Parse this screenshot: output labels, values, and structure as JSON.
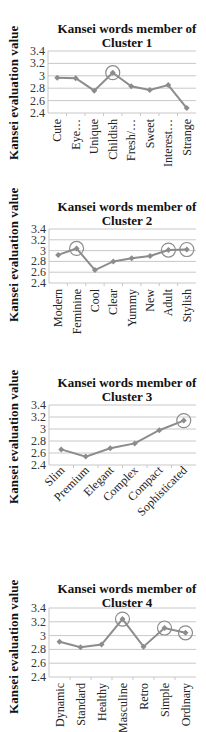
{
  "y_axis_label": "Kansei evaluation value",
  "y_ticks": [
    "3.4",
    "3.2",
    "3",
    "2.8",
    "2.6",
    "2.4"
  ],
  "colors": {
    "line": "#8c8c8c",
    "marker": "#8c8c8c",
    "grid": "#c8c8c8",
    "highlight_circle": "#8c8c8c"
  },
  "charts": [
    {
      "title_line1": "Kansei words member of",
      "title_line2": "Cluster 1",
      "categories": [
        "Cute",
        "Eye…",
        "Unique",
        "Childish",
        "Fresh/…",
        "Sweet",
        "Interest…",
        "Strange"
      ],
      "values": [
        2.97,
        2.96,
        2.76,
        3.05,
        2.83,
        2.77,
        2.85,
        2.48
      ],
      "highlighted": [
        "Childish"
      ]
    },
    {
      "title_line1": "Kansei words member of",
      "title_line2": "Cluster 2",
      "categories": [
        "Modern",
        "Feminine",
        "Cool",
        "Clear",
        "Yummy",
        "New",
        "Adult",
        "Stylish"
      ],
      "values": [
        2.92,
        3.04,
        2.64,
        2.8,
        2.86,
        2.9,
        3.01,
        3.02
      ],
      "highlighted": [
        "Feminine",
        "Adult",
        "Stylish"
      ]
    },
    {
      "title_line1": "Kansei words member of",
      "title_line2": "Cluster 3",
      "categories": [
        "Slim",
        "Premium",
        "Elegant",
        "Complex",
        "Compact",
        "Sophisticated"
      ],
      "values": [
        2.66,
        2.54,
        2.68,
        2.76,
        2.98,
        3.14
      ],
      "highlighted": [
        "Sophisticated"
      ]
    },
    {
      "title_line1": "Kansei words member of",
      "title_line2": "Cluster 4",
      "categories": [
        "Dynamic",
        "Standard",
        "Healthy",
        "Masculine",
        "Retro",
        "Simple",
        "Ordinary"
      ],
      "values": [
        2.91,
        2.83,
        2.87,
        3.24,
        2.84,
        3.11,
        3.04
      ],
      "highlighted": [
        "Masculine",
        "Simple",
        "Ordinary"
      ]
    }
  ],
  "chart_data": [
    {
      "type": "line",
      "title": "Kansei words member of Cluster 1",
      "xlabel": "",
      "ylabel": "Kansei evaluation value",
      "ylim": [
        2.4,
        3.4
      ],
      "yticks": [
        2.4,
        2.6,
        2.8,
        3.0,
        3.2,
        3.4
      ],
      "grid": true,
      "categories": [
        "Cute",
        "Eye…",
        "Unique",
        "Childish",
        "Fresh/…",
        "Sweet",
        "Interest…",
        "Strange"
      ],
      "values": [
        2.97,
        2.96,
        2.76,
        3.05,
        2.83,
        2.77,
        2.85,
        2.48
      ],
      "annotations": [
        "circle around Childish"
      ]
    },
    {
      "type": "line",
      "title": "Kansei words member of Cluster 2",
      "xlabel": "",
      "ylabel": "Kansei evaluation value",
      "ylim": [
        2.4,
        3.4
      ],
      "yticks": [
        2.4,
        2.6,
        2.8,
        3.0,
        3.2,
        3.4
      ],
      "grid": true,
      "categories": [
        "Modern",
        "Feminine",
        "Cool",
        "Clear",
        "Yummy",
        "New",
        "Adult",
        "Stylish"
      ],
      "values": [
        2.92,
        3.04,
        2.64,
        2.8,
        2.86,
        2.9,
        3.01,
        3.02
      ],
      "annotations": [
        "circle around Feminine",
        "circle around Adult",
        "circle around Stylish"
      ]
    },
    {
      "type": "line",
      "title": "Kansei words member of Cluster 3",
      "xlabel": "",
      "ylabel": "Kansei evaluation value",
      "ylim": [
        2.4,
        3.4
      ],
      "yticks": [
        2.4,
        2.6,
        2.8,
        3.0,
        3.2,
        3.4
      ],
      "grid": true,
      "categories": [
        "Slim",
        "Premium",
        "Elegant",
        "Complex",
        "Compact",
        "Sophisticated"
      ],
      "values": [
        2.66,
        2.54,
        2.68,
        2.76,
        2.98,
        3.14
      ],
      "annotations": [
        "circle around Sophisticated"
      ]
    },
    {
      "type": "line",
      "title": "Kansei words member of Cluster 4",
      "xlabel": "",
      "ylabel": "Kansei evaluation value",
      "ylim": [
        2.4,
        3.4
      ],
      "yticks": [
        2.4,
        2.6,
        2.8,
        3.0,
        3.2,
        3.4
      ],
      "grid": true,
      "categories": [
        "Dynamic",
        "Standard",
        "Healthy",
        "Masculine",
        "Retro",
        "Simple",
        "Ordinary"
      ],
      "values": [
        2.91,
        2.83,
        2.87,
        3.24,
        2.84,
        3.11,
        3.04
      ],
      "annotations": [
        "circle around Masculine",
        "circle around Simple",
        "circle around Ordinary"
      ]
    }
  ]
}
